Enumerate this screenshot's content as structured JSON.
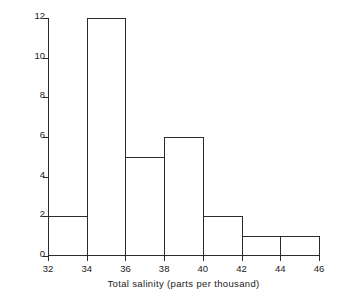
{
  "chart_data": {
    "type": "bar",
    "title": "",
    "xlabel": "Total salinity (parts per thousand)",
    "ylabel": "Number of samples",
    "bin_edges": [
      32,
      34,
      36,
      38,
      40,
      42,
      44,
      46
    ],
    "categories": [
      "32-34",
      "34-36",
      "36-38",
      "38-40",
      "40-42",
      "42-44",
      "44-46"
    ],
    "values": [
      2,
      12,
      5,
      6,
      2,
      1,
      1
    ],
    "xlim": [
      32,
      46
    ],
    "ylim": [
      0,
      12
    ],
    "xticks": [
      32,
      34,
      36,
      38,
      40,
      42,
      44,
      46
    ],
    "yticks": [
      0,
      2,
      4,
      6,
      8,
      10,
      12
    ],
    "xtick_labels": [
      "32",
      "34",
      "36",
      "38",
      "40",
      "42",
      "44",
      "46"
    ],
    "ytick_labels": [
      "0",
      "2",
      "4",
      "6",
      "8",
      "10",
      "12"
    ],
    "grid": false,
    "legend": null,
    "bar_style": "outline",
    "line_color": "#2b2b2b",
    "fill_color": "#ffffff",
    "background": "#ffffff"
  }
}
